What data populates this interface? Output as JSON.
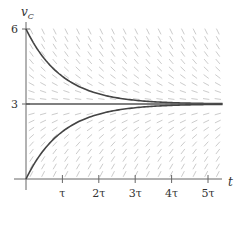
{
  "chart_data": {
    "type": "line",
    "title": "",
    "xlabel": "t",
    "ylabel": "v_C",
    "ylabel_main": "v",
    "ylabel_sub": "C",
    "x_ticks": [
      "τ",
      "2τ",
      "3τ",
      "4τ",
      "5τ"
    ],
    "x_tick_values": [
      1,
      2,
      3,
      4,
      5
    ],
    "y_ticks": [
      "3",
      "6"
    ],
    "y_tick_values": [
      3,
      6
    ],
    "xlim": [
      0,
      5.4
    ],
    "ylim": [
      0,
      6.3
    ],
    "grid": false,
    "background": "slope field",
    "series": [
      {
        "name": "discharging from 6",
        "formula": "3 + 3*exp(-t/tau)",
        "x": [
          0,
          0.5,
          1,
          1.5,
          2,
          3,
          4,
          5,
          5.4
        ],
        "values": [
          6,
          4.82,
          4.1,
          3.67,
          3.41,
          3.15,
          3.05,
          3.02,
          3.01
        ]
      },
      {
        "name": "equilibrium",
        "formula": "3",
        "x": [
          0,
          5.4
        ],
        "values": [
          3,
          3
        ]
      },
      {
        "name": "charging from 0",
        "formula": "3*(1 - exp(-t/tau))",
        "x": [
          0,
          0.5,
          1,
          1.5,
          2,
          3,
          4,
          5,
          5.4
        ],
        "values": [
          0,
          1.18,
          1.9,
          2.33,
          2.59,
          2.85,
          2.95,
          2.98,
          2.99
        ]
      }
    ],
    "colors": {
      "curve": "#444444",
      "axis": "#555555",
      "slope_field": "#cccccc"
    }
  }
}
